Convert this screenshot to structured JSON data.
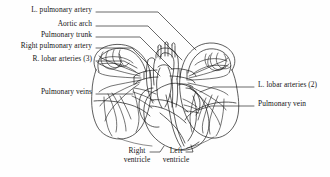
{
  "figure": {
    "style": "black-and-white line drawing",
    "background_color": "#fefefe",
    "ink_color": "#141414"
  },
  "labels": {
    "left": [
      {
        "id": "l-pulmonary-artery",
        "text": "L. pulmonary artery",
        "text_x": 92,
        "text_y": 10,
        "leader": [
          [
            96,
            12
          ],
          [
            158,
            12
          ],
          [
            196,
            50
          ]
        ]
      },
      {
        "id": "aortic-arch",
        "text": "Aortic arch",
        "text_x": 92,
        "text_y": 24,
        "leader": [
          [
            96,
            26
          ],
          [
            148,
            26
          ],
          [
            182,
            60
          ]
        ]
      },
      {
        "id": "pulmonary-trunk",
        "text": "Pulmonary trunk",
        "text_x": 92,
        "text_y": 35,
        "leader": [
          [
            96,
            37
          ],
          [
            140,
            37
          ],
          [
            172,
            69
          ]
        ]
      },
      {
        "id": "right-pulmonary-artery",
        "text": "Right pulmonary artery",
        "text_x": 92,
        "text_y": 46,
        "leader": [
          [
            96,
            48
          ],
          [
            132,
            48
          ],
          [
            160,
            76
          ]
        ]
      },
      {
        "id": "r-lobar-arteries",
        "text": "R. lobar arteries (3)",
        "text_x": 92,
        "text_y": 59,
        "leader": [
          [
            96,
            61
          ],
          [
            124,
            61
          ],
          [
            137,
            68
          ]
        ]
      },
      {
        "id": "pulmonary-veins",
        "text": "Pulmonary veins",
        "text_x": 92,
        "text_y": 92,
        "leader": [
          [
            96,
            94
          ],
          [
            132,
            94
          ]
        ]
      }
    ],
    "right": [
      {
        "id": "l-lobar-arteries",
        "text": "L. lobar arteries (2)",
        "text_x": 258,
        "text_y": 85,
        "leader": [
          [
            254,
            87
          ],
          [
            212,
            87
          ],
          [
            200,
            92
          ]
        ]
      },
      {
        "id": "pulmonary-vein",
        "text": "Pulmonary vein",
        "text_x": 258,
        "text_y": 104,
        "leader": [
          [
            254,
            106
          ],
          [
            210,
            106
          ],
          [
            198,
            110
          ]
        ]
      }
    ],
    "bottom": [
      {
        "id": "right-ventricle",
        "line1": "Right",
        "line2": "ventricle",
        "text_x": 137,
        "text_y": 150,
        "leader": [
          [
            150,
            152
          ],
          [
            160,
            152
          ],
          [
            163,
            146
          ]
        ]
      },
      {
        "id": "left-ventricle",
        "line1": "Left",
        "line2": "ventricle",
        "text_x": 176,
        "text_y": 150,
        "leader": [
          [
            186,
            152
          ],
          [
            193,
            152
          ],
          [
            191,
            145
          ]
        ]
      }
    ]
  }
}
